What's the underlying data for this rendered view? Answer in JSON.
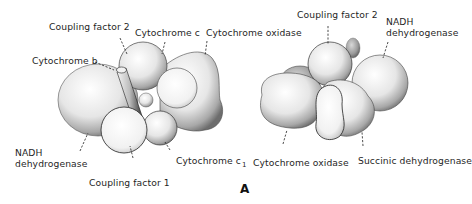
{
  "figure": {
    "panel_label": "A",
    "left_complex": {
      "labels": {
        "coupling_factor_2": "Coupling factor 2",
        "cytochrome_c": "Cytochrome c",
        "cytochrome_oxidase": "Cytochrome oxidase",
        "cytochrome_b": "Cytochrome b",
        "nadh_line1": "NADH",
        "nadh_line2": "dehydrogenase",
        "coupling_factor_1": "Coupling factor 1",
        "cytochrome_c1_main": "Cytochrome c",
        "cytochrome_c1_sub": "1"
      }
    },
    "right_complex": {
      "labels": {
        "coupling_factor_2": "Coupling factor 2",
        "nadh_line1": "NADH",
        "nadh_line2": "dehydrogenase",
        "cytochrome_oxidase": "Cytochrome oxidase",
        "succinic_dehydrogenase": "Succinic dehydrogenase"
      }
    }
  }
}
